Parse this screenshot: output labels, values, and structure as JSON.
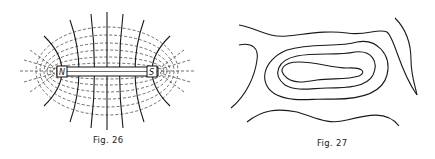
{
  "figures": [
    {
      "id": "fig26",
      "caption": "Fig. 26",
      "subject": "magnetic field lines around a bar magnet",
      "magnet": {
        "north_label": "N",
        "south_label": "S"
      }
    },
    {
      "id": "fig27",
      "caption": "Fig. 27",
      "subject": "contour lines"
    }
  ]
}
